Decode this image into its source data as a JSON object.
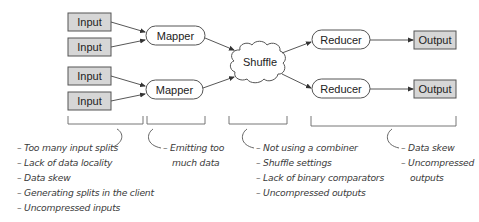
{
  "diagram": {
    "inputs": [
      {
        "label": "Input"
      },
      {
        "label": "Input"
      },
      {
        "label": "Input"
      },
      {
        "label": "Input"
      }
    ],
    "mappers": [
      {
        "label": "Mapper"
      },
      {
        "label": "Mapper"
      }
    ],
    "shuffle": {
      "label": "Shuffle"
    },
    "reducers": [
      {
        "label": "Reducer"
      },
      {
        "label": "Reducer"
      }
    ],
    "outputs": [
      {
        "label": "Output"
      },
      {
        "label": "Output"
      }
    ],
    "colors": {
      "box_fill": "#d6d6d6",
      "stroke": "#555555",
      "bracket": "#666666"
    }
  },
  "annotations": {
    "input": [
      "– Too many input splits",
      "– Lack of data locality",
      "– Data skew",
      "– Generating splits in the client",
      "– Uncompressed inputs"
    ],
    "mapper": [
      "– Emitting too",
      "much data"
    ],
    "shuffle": [
      "– Not using a combiner",
      "– Shuffle settings",
      "– Lack of binary comparators",
      "– Uncompressed outputs"
    ],
    "reducer": [
      "– Data skew",
      "– Uncompressed",
      "outputs"
    ]
  }
}
